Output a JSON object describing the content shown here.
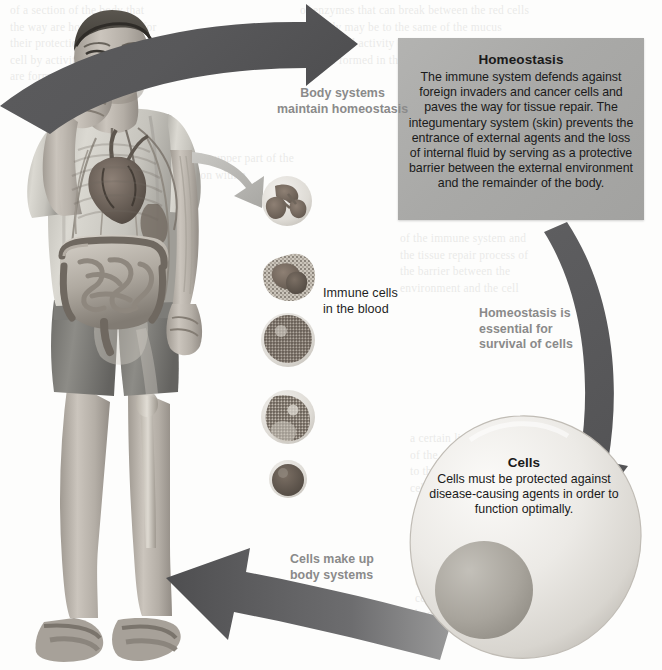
{
  "figure": {
    "type": "cycle-diagram"
  },
  "panels": {
    "homeostasis": {
      "title": "Homeostasis",
      "body": "The immune system defends against foreign invaders and cancer cells and paves the way for tissue repair. The integumentary system (skin) prevents the entrance of external agents and the loss of internal fluid by serving as a protective barrier between the external environment and the remainder of the body.",
      "bg_color": "#a9a9a7"
    },
    "cells": {
      "title": "Cells",
      "body": "Cells must be protected against disease-causing agents in order to function optimally.",
      "bg_color": "#e6e5e3"
    }
  },
  "labels": {
    "body_systems": "Body systems\nmaintain homeostasis",
    "homeostasis_essential": "Homeostasis is\nessential for\nsurvival of cells",
    "cells_make_up": "Cells make up\nbody systems",
    "immune_cells": "Immune cells\nin the blood"
  },
  "illustration": {
    "person": "man-coughing-with-visible-anatomy",
    "blood_cells": [
      "neutrophil",
      "eosinophil",
      "lymphocyte",
      "monocyte",
      "basophil"
    ]
  },
  "colors": {
    "arrow_dark": "#58585a",
    "arrow_light": "#b9b9b7",
    "label_gray": "#8a8a8a",
    "page_bg": "#fdfdfc"
  },
  "ghost_text": {
    "top_left": "of a section of the body that\nthe way are housed and act for their protection\ncell by activity of the immune that\nare formed in the mucus.",
    "top_right": "of enzymes that can break between the red cells\nthe body may be to the same of the mucus\nand the cell activity of the immune system\nthat are formed in the epithelium.",
    "mid_left": "shown in the upper part of the\nis in position within",
    "mid_right": "of the immune system and\nthe tissue repair process of\nthe barrier between the\nenvironment and the cell",
    "lower_mid": "a certain limit and also\nof the cells which in some\nto the cell and also to the\ncells and also form the",
    "lower_right": "up on the surface of the\nthe vessel and in the\nbarrier against the\ncell and also the\nbody"
  }
}
